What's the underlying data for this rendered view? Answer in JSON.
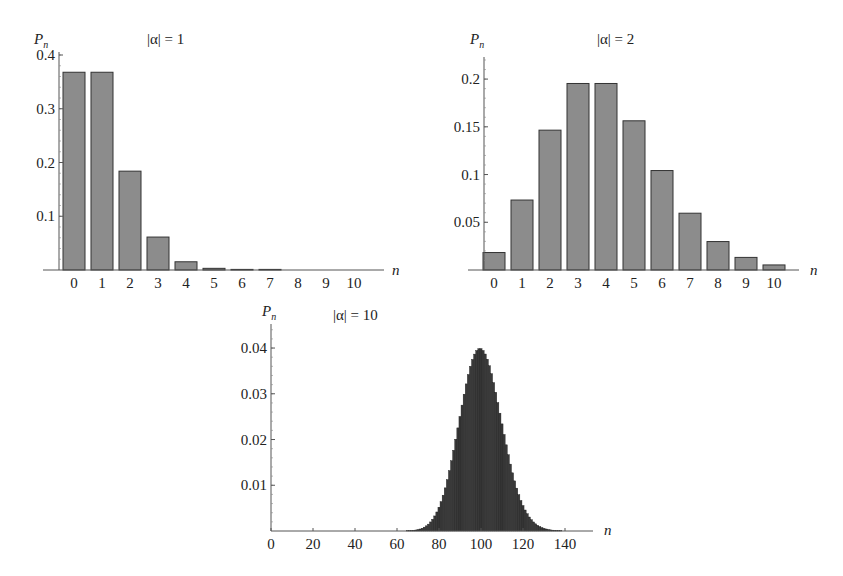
{
  "page": {
    "header_text": "",
    "page_number": ""
  },
  "chart_data": [
    {
      "type": "bar",
      "title": "|α| = 1",
      "xlabel": "n",
      "ylabel": "P",
      "ylabel_sub": "n",
      "categories": [
        "0",
        "1",
        "2",
        "3",
        "4",
        "5",
        "6",
        "7",
        "8",
        "9",
        "10"
      ],
      "values": [
        0.3679,
        0.3679,
        0.1839,
        0.0613,
        0.0153,
        0.0031,
        0.0005,
        0.0001,
        0.0,
        0.0,
        0.0
      ],
      "yticks": [
        0.1,
        0.2,
        0.3,
        0.4
      ],
      "ytick_labels": [
        "0.1",
        "0.2",
        "0.3",
        "0.4"
      ],
      "ylim": [
        0,
        0.4
      ],
      "grid": false,
      "bar_color": "#8c8c8c",
      "bar_edge": "#333333"
    },
    {
      "type": "bar",
      "title": "|α| = 2",
      "xlabel": "n",
      "ylabel": "P",
      "ylabel_sub": "n",
      "categories": [
        "0",
        "1",
        "2",
        "3",
        "4",
        "5",
        "6",
        "7",
        "8",
        "9",
        "10"
      ],
      "values": [
        0.0183,
        0.0733,
        0.1465,
        0.1954,
        0.1954,
        0.1563,
        0.1042,
        0.0595,
        0.0298,
        0.0132,
        0.0053
      ],
      "yticks": [
        0.05,
        0.1,
        0.15,
        0.2
      ],
      "ytick_labels": [
        "0.05",
        "0.1",
        "0.15",
        "0.2"
      ],
      "ylim": [
        0,
        0.22
      ],
      "grid": false,
      "bar_color": "#8c8c8c",
      "bar_edge": "#333333"
    },
    {
      "type": "bar",
      "title": "|α| = 10",
      "xlabel": "n",
      "ylabel": "P",
      "ylabel_sub": "n",
      "x_start": 60,
      "values": [
        1e-05,
        1e-05,
        1e-05,
        2e-05,
        3e-05,
        5e-05,
        7e-05,
        0.0001,
        0.00015,
        0.00022,
        0.00031,
        0.00044,
        0.00061,
        0.00084,
        0.00113,
        0.0015,
        0.00198,
        0.00257,
        0.00329,
        0.00416,
        0.0052,
        0.00642,
        0.00783,
        0.00943,
        0.01123,
        0.01321,
        0.01536,
        0.01765,
        0.02006,
        0.02254,
        0.02504,
        0.02752,
        0.02991,
        0.03216,
        0.03421,
        0.03601,
        0.03751,
        0.03867,
        0.03946,
        0.03986,
        0.03986,
        0.03946,
        0.03869,
        0.03756,
        0.03612,
        0.0344,
        0.03245,
        0.03033,
        0.02808,
        0.02576,
        0.02342,
        0.0211,
        0.01884,
        0.01667,
        0.01462,
        0.01272,
        0.01096,
        0.00937,
        0.00794,
        0.00667,
        0.00556,
        0.00459,
        0.00377,
        0.00306,
        0.00247,
        0.00198,
        0.00157,
        0.00124,
        0.00097,
        0.00075,
        0.00058,
        0.00044,
        0.00033,
        0.00025,
        0.00019,
        0.00014,
        0.0001,
        7e-05,
        5e-05,
        4e-05,
        3e-05
      ],
      "xticks": [
        0,
        20,
        40,
        60,
        80,
        100,
        120,
        140
      ],
      "xtick_labels": [
        "0",
        "20",
        "40",
        "60",
        "80",
        "100",
        "120",
        "140"
      ],
      "xlim": [
        0,
        153
      ],
      "yticks": [
        0.01,
        0.02,
        0.03,
        0.04
      ],
      "ytick_labels": [
        "0.01",
        "0.02",
        "0.03",
        "0.04"
      ],
      "ylim": [
        0,
        0.044
      ],
      "grid": false,
      "bar_color": "#3a3a3a",
      "bar_edge": "#1a1a1a"
    }
  ]
}
